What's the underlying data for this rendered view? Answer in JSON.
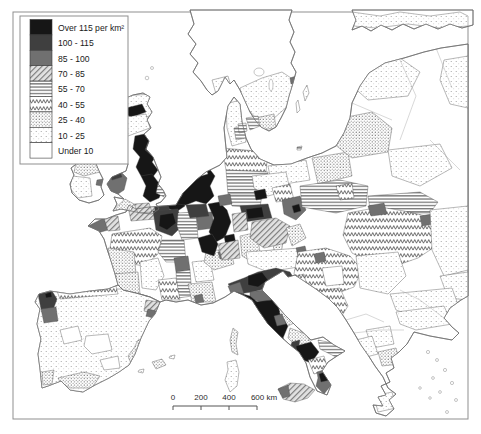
{
  "legend": {
    "entries": [
      {
        "id": "over-115",
        "label": "Over 115 per km²",
        "color": "#161616"
      },
      {
        "id": "100-115",
        "label": "100 - 115",
        "color": "#3f3f3f"
      },
      {
        "id": "85-100",
        "label": "85 - 100",
        "color": "#707070"
      },
      {
        "id": "70-85",
        "label": "70 - 85",
        "pattern": "hatch"
      },
      {
        "id": "55-70",
        "label": "55 - 70",
        "pattern": "hlines"
      },
      {
        "id": "40-55",
        "label": "40 - 55",
        "pattern": "zigzag"
      },
      {
        "id": "25-40",
        "label": "25 - 40",
        "pattern": "dots-dense"
      },
      {
        "id": "10-25",
        "label": "10 - 25",
        "pattern": "dots-sparse"
      },
      {
        "id": "under-10",
        "label": "Under 10",
        "color": "#ffffff"
      }
    ]
  },
  "scale_bar": {
    "labels": [
      "0",
      "200",
      "400",
      "600 km"
    ]
  },
  "colors": {
    "coastline": "#6e6e6e",
    "region_border": "#4d4d4d",
    "frame": "#8f8f8f",
    "sea": "#ffffff"
  }
}
